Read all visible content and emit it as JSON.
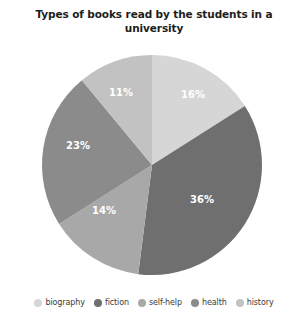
{
  "chart_data": {
    "type": "pie",
    "title": "Types of books read by the students in a university",
    "categories": [
      "biography",
      "fiction",
      "self-help",
      "health",
      "history"
    ],
    "values": [
      16,
      36,
      14,
      23,
      11
    ],
    "data_labels": [
      "16%",
      "36%",
      "14%",
      "23%",
      "11%"
    ],
    "unit": "%",
    "start_angle_deg": 0,
    "direction": "clockwise",
    "legend_position": "bottom",
    "grid": false,
    "colors": [
      "#d6d6d6",
      "#6f6f6f",
      "#a8a8a8",
      "#8b8b8b",
      "#c2c2c2"
    ],
    "label_color": "#ffffff",
    "background": "#ffffff",
    "slices": [
      {
        "name": "biography",
        "value": 16,
        "label": "16%",
        "color": "#d6d6d6",
        "label_x": 193,
        "label_y": 47
      },
      {
        "name": "fiction",
        "value": 36,
        "label": "36%",
        "color": "#6f6f6f",
        "label_x": 202,
        "label_y": 152
      },
      {
        "name": "self-help",
        "value": 14,
        "label": "14%",
        "color": "#a8a8a8",
        "label_x": 104,
        "label_y": 163
      },
      {
        "name": "health",
        "value": 23,
        "label": "23%",
        "color": "#8b8b8b",
        "label_x": 78,
        "label_y": 98
      },
      {
        "name": "history",
        "value": 11,
        "label": "11%",
        "color": "#c2c2c2",
        "label_x": 121,
        "label_y": 45
      }
    ]
  },
  "legend": {
    "items": [
      {
        "label": "biography",
        "color": "#d6d6d6"
      },
      {
        "label": "fiction",
        "color": "#6f6f6f"
      },
      {
        "label": "self-help",
        "color": "#a8a8a8"
      },
      {
        "label": "health",
        "color": "#8b8b8b"
      },
      {
        "label": "history",
        "color": "#c2c2c2"
      }
    ]
  }
}
